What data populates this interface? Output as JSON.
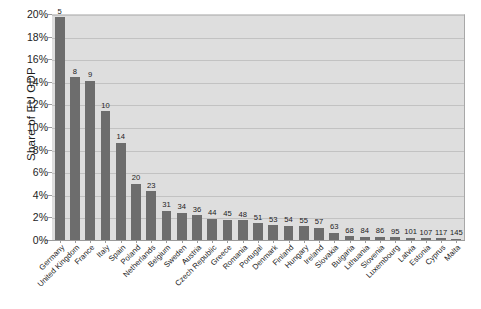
{
  "chart_data": {
    "type": "bar",
    "title": "",
    "xlabel": "",
    "ylabel": "Share of EU GDP",
    "ylim": [
      0,
      20
    ],
    "ytick_labels": [
      "0%",
      "2%",
      "4%",
      "6%",
      "8%",
      "10%",
      "12%",
      "14%",
      "16%",
      "18%",
      "20%"
    ],
    "ytick_values": [
      0,
      2,
      4,
      6,
      8,
      10,
      12,
      14,
      16,
      18,
      20
    ],
    "grid": true,
    "legend": "none",
    "units": "percent",
    "categories": [
      "Germany",
      "United Kingdom",
      "France",
      "Italy",
      "Spain",
      "Poland",
      "Netherlands",
      "Belgium",
      "Sweden",
      "Austria",
      "Czech Republic",
      "Greece",
      "Romania",
      "Portugal",
      "Denmark",
      "Finland",
      "Hungary",
      "Ireland",
      "Slovakia",
      "Bulgaria",
      "Lithuania",
      "Slovenia",
      "Luxembourg",
      "Latvia",
      "Estonia",
      "Cyprus",
      "Malta"
    ],
    "values": [
      19.7,
      14.4,
      14.1,
      11.4,
      8.6,
      5.0,
      4.3,
      2.6,
      2.4,
      2.2,
      1.9,
      1.8,
      1.75,
      1.5,
      1.3,
      1.25,
      1.2,
      1.1,
      0.65,
      0.35,
      0.3,
      0.28,
      0.26,
      0.2,
      0.16,
      0.14,
      0.1
    ],
    "point_labels": [
      "5",
      "8",
      "9",
      "10",
      "14",
      "20",
      "23",
      "31",
      "34",
      "36",
      "44",
      "45",
      "48",
      "51",
      "53",
      "54",
      "55",
      "57",
      "63",
      "68",
      "84",
      "86",
      "95",
      "101",
      "107",
      "117",
      "145"
    ],
    "colors": {
      "bar": "#6d6d6d",
      "plot_background": "#dedede",
      "gridline": "#c2c2c2",
      "text": "#1c1c1c",
      "axis": "#9a9a9a",
      "page_background": "#ffffff"
    }
  }
}
